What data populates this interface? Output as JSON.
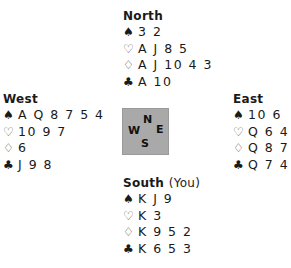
{
  "symbols": {
    "spades": "♠",
    "hearts": "♡",
    "diamonds": "♢",
    "clubs": "♣"
  },
  "compass": {
    "n": "N",
    "w": "W",
    "e": "E",
    "s": "S",
    "background": "#a9a9a9"
  },
  "hands": {
    "north": {
      "name": "North",
      "suffix": "",
      "spades": "3 2",
      "hearts": "A J 8 5",
      "diamonds": "A J 10 4 3",
      "clubs": "A 10"
    },
    "west": {
      "name": "West",
      "suffix": "",
      "spades": "A Q 8 7 5 4",
      "hearts": "10 9 7",
      "diamonds": "6",
      "clubs": "J 9 8"
    },
    "east": {
      "name": "East",
      "suffix": "",
      "spades": "10 6",
      "hearts": "Q 6 4 2",
      "diamonds": "Q 8 7",
      "clubs": "Q 7 4 2"
    },
    "south": {
      "name": "South",
      "suffix": "(You)",
      "spades": "K J 9",
      "hearts": "K 3",
      "diamonds": "K 9 5 2",
      "clubs": "K 6 5 3"
    }
  }
}
